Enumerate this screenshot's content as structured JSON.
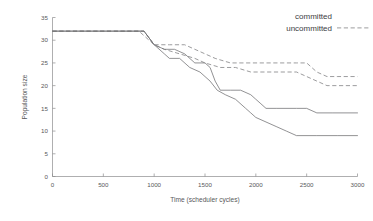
{
  "chart_data": {
    "type": "line",
    "title": "",
    "xlabel": "Time (scheduler cycles)",
    "ylabel": "Population size",
    "xlim": [
      0,
      3000
    ],
    "ylim": [
      0,
      35
    ],
    "grid": false,
    "legend_position": "top-right",
    "xticks": [
      "0",
      "500",
      "1000",
      "1500",
      "2000",
      "2500",
      "3000"
    ],
    "xtick_values": [
      0,
      500,
      1000,
      1500,
      2000,
      2500,
      3000
    ],
    "yticks": [
      "0",
      "5",
      "10",
      "15",
      "20",
      "25",
      "30",
      "35"
    ],
    "ytick_values": [
      0,
      5,
      10,
      15,
      20,
      25,
      30,
      35
    ],
    "legend": [
      {
        "label": "committed",
        "style": "solid",
        "color": "#6e6e70"
      },
      {
        "label": "uncommitted",
        "style": "dashed",
        "color": "#8a8a8c"
      }
    ],
    "series": [
      {
        "name": "uncommitted-a",
        "style": "dashed",
        "color": "#8a8a8c",
        "points": [
          [
            0,
            32
          ],
          [
            600,
            32
          ],
          [
            900,
            32
          ],
          [
            1000,
            29
          ],
          [
            1150,
            29
          ],
          [
            1300,
            29
          ],
          [
            1400,
            28
          ],
          [
            1500,
            27
          ],
          [
            1600,
            26
          ],
          [
            1750,
            25
          ],
          [
            1900,
            25
          ],
          [
            2100,
            25
          ],
          [
            2300,
            25
          ],
          [
            2400,
            25
          ],
          [
            2500,
            25
          ],
          [
            2600,
            23
          ],
          [
            2700,
            22
          ],
          [
            2800,
            22
          ],
          [
            3000,
            22
          ]
        ]
      },
      {
        "name": "uncommitted-b",
        "style": "dashed",
        "color": "#8a8a8c",
        "points": [
          [
            0,
            32
          ],
          [
            600,
            32
          ],
          [
            850,
            32
          ],
          [
            1000,
            29
          ],
          [
            1100,
            28
          ],
          [
            1250,
            27
          ],
          [
            1400,
            26
          ],
          [
            1500,
            25
          ],
          [
            1650,
            24
          ],
          [
            1800,
            24
          ],
          [
            1950,
            23
          ],
          [
            2100,
            23
          ],
          [
            2300,
            23
          ],
          [
            2400,
            23
          ],
          [
            2500,
            22
          ],
          [
            2600,
            21
          ],
          [
            2700,
            20
          ],
          [
            2800,
            20
          ],
          [
            3000,
            20
          ]
        ]
      },
      {
        "name": "committed-a",
        "style": "solid",
        "color": "#6e6e70",
        "points": [
          [
            0,
            32
          ],
          [
            600,
            32
          ],
          [
            900,
            32
          ],
          [
            1000,
            29
          ],
          [
            1100,
            28
          ],
          [
            1200,
            28
          ],
          [
            1300,
            27
          ],
          [
            1400,
            25
          ],
          [
            1500,
            25
          ],
          [
            1550,
            24
          ],
          [
            1600,
            21
          ],
          [
            1650,
            19
          ],
          [
            1750,
            19
          ],
          [
            1850,
            19
          ],
          [
            1950,
            18
          ],
          [
            2000,
            17
          ],
          [
            2050,
            16
          ],
          [
            2100,
            15
          ],
          [
            2200,
            15
          ],
          [
            2400,
            15
          ],
          [
            2500,
            15
          ],
          [
            2600,
            14
          ],
          [
            2750,
            14
          ],
          [
            3000,
            14
          ]
        ]
      },
      {
        "name": "committed-b",
        "style": "solid",
        "color": "#6e6e70",
        "points": [
          [
            0,
            32
          ],
          [
            600,
            32
          ],
          [
            900,
            32
          ],
          [
            1000,
            29
          ],
          [
            1100,
            27
          ],
          [
            1150,
            26
          ],
          [
            1250,
            26
          ],
          [
            1350,
            24
          ],
          [
            1450,
            23
          ],
          [
            1550,
            21
          ],
          [
            1620,
            19
          ],
          [
            1700,
            18
          ],
          [
            1800,
            17
          ],
          [
            1900,
            15
          ],
          [
            1950,
            14
          ],
          [
            2000,
            13
          ],
          [
            2100,
            12
          ],
          [
            2200,
            11
          ],
          [
            2300,
            10
          ],
          [
            2400,
            9
          ],
          [
            2600,
            9
          ],
          [
            2800,
            9
          ],
          [
            3000,
            9
          ]
        ]
      }
    ]
  }
}
